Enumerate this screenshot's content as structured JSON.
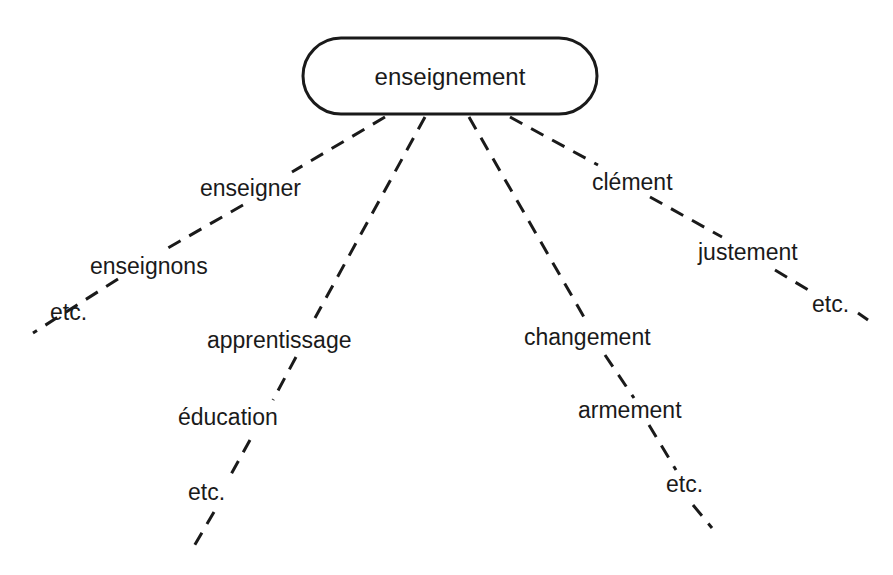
{
  "root": {
    "label": "enseignement",
    "box": {
      "x": 303,
      "y": 38,
      "width": 294,
      "height": 76,
      "rx": 38
    },
    "text": {
      "x": 450,
      "y": 85
    }
  },
  "branches": [
    {
      "id": "morphological",
      "segments": [
        {
          "x1": 385,
          "y1": 117,
          "x2": 292,
          "y2": 172
        },
        {
          "x1": 243,
          "y1": 205,
          "x2": 168,
          "y2": 248
        },
        {
          "x1": 118,
          "y1": 279,
          "x2": 33,
          "y2": 333
        }
      ],
      "labels": [
        {
          "text": "enseigner",
          "x": 200,
          "y": 196
        },
        {
          "text": "enseignons",
          "x": 90,
          "y": 274
        },
        {
          "text": "etc.",
          "x": 50,
          "y": 320
        }
      ]
    },
    {
      "id": "semantic",
      "segments": [
        {
          "x1": 425,
          "y1": 117,
          "x2": 315,
          "y2": 318
        },
        {
          "x1": 296,
          "y1": 357,
          "x2": 273,
          "y2": 400
        },
        {
          "x1": 250,
          "y1": 440,
          "x2": 229,
          "y2": 478
        },
        {
          "x1": 214,
          "y1": 512,
          "x2": 193,
          "y2": 548
        }
      ],
      "labels": [
        {
          "text": "apprentissage",
          "x": 207,
          "y": 348
        },
        {
          "text": "éducation",
          "x": 178,
          "y": 425
        },
        {
          "text": "etc.",
          "x": 188,
          "y": 500
        }
      ]
    },
    {
      "id": "suffix",
      "segments": [
        {
          "x1": 469,
          "y1": 117,
          "x2": 588,
          "y2": 324
        },
        {
          "x1": 605,
          "y1": 355,
          "x2": 634,
          "y2": 398
        },
        {
          "x1": 649,
          "y1": 425,
          "x2": 676,
          "y2": 470
        },
        {
          "x1": 693,
          "y1": 505,
          "x2": 712,
          "y2": 528
        }
      ],
      "labels": [
        {
          "text": "changement",
          "x": 524,
          "y": 345
        },
        {
          "text": "armement",
          "x": 578,
          "y": 418
        },
        {
          "text": "etc.",
          "x": 666,
          "y": 492
        }
      ]
    },
    {
      "id": "rhyme",
      "segments": [
        {
          "x1": 510,
          "y1": 117,
          "x2": 598,
          "y2": 165
        },
        {
          "x1": 650,
          "y1": 197,
          "x2": 722,
          "y2": 237
        },
        {
          "x1": 775,
          "y1": 270,
          "x2": 810,
          "y2": 291
        },
        {
          "x1": 858,
          "y1": 313,
          "x2": 868,
          "y2": 320
        }
      ],
      "labels": [
        {
          "text": "clément",
          "x": 592,
          "y": 190
        },
        {
          "text": "justement",
          "x": 698,
          "y": 260
        },
        {
          "text": "etc.",
          "x": 812,
          "y": 312
        }
      ]
    }
  ]
}
